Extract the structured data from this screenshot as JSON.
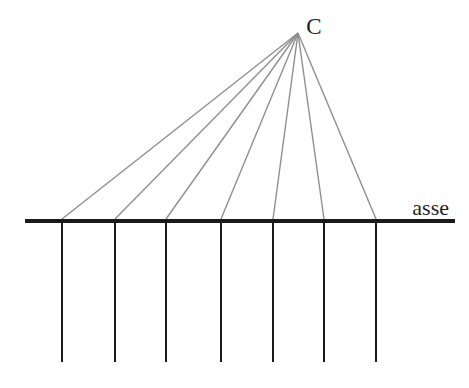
{
  "diagram": {
    "center_label": "C",
    "axis_label": "asse",
    "colors": {
      "background": "#ffffff",
      "axis": "#1a1a1a",
      "verticals": "#1a1a1a",
      "rays": "#8f8f8f",
      "text": "#1f1f1f"
    },
    "geometry": {
      "canvas": {
        "width": 469,
        "height": 388
      },
      "apex": {
        "x": 298,
        "y": 33
      },
      "axis": {
        "y": 221,
        "x1": 25,
        "x2": 455,
        "thickness": 4
      },
      "axis_points_x": [
        62,
        115,
        166,
        221,
        273,
        324,
        376
      ],
      "verticals_bottom_y": 362,
      "vertical_width": 2,
      "ray_width": 1.4,
      "c_label": {
        "x": 314,
        "y": 34,
        "font_size": 23
      },
      "asse_label": {
        "x": 449,
        "y": 215,
        "font_size": 22
      }
    }
  }
}
